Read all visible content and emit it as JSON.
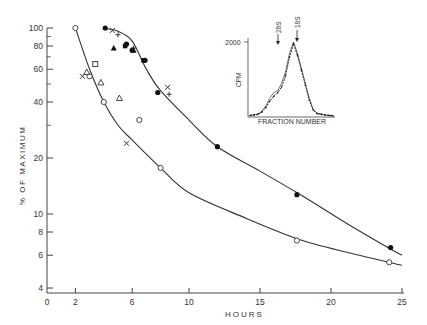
{
  "chart_data": [
    {
      "type": "scatter",
      "title": "",
      "xlabel": "HOURS",
      "ylabel": "% OF MAXIMUM",
      "yscale": "log",
      "xlim": [
        0,
        25
      ],
      "ylim": [
        4,
        100
      ],
      "x_ticks": [
        0,
        2,
        6,
        10,
        15,
        20,
        25
      ],
      "y_ticks": [
        4,
        6,
        8,
        10,
        20,
        40,
        60,
        80,
        100
      ],
      "y_tick_labels": [
        "4",
        "6",
        "8",
        "10",
        "20",
        "40",
        "60",
        "80",
        "100"
      ],
      "grid": false,
      "series": [
        {
          "name": "upper curve (filled circles)",
          "marker": "filled-circle",
          "fit_curve": [
            [
              4,
              100
            ],
            [
              5,
              96
            ],
            [
              6,
              85
            ],
            [
              7,
              60
            ],
            [
              8,
              46
            ],
            [
              10,
              32
            ],
            [
              12,
              23
            ],
            [
              15,
              17
            ],
            [
              18,
              12.5
            ],
            [
              21,
              9
            ],
            [
              24,
              6.6
            ],
            [
              25,
              6
            ]
          ],
          "points": [
            [
              4.1,
              100
            ],
            [
              5.6,
              82
            ],
            [
              6.0,
              76
            ],
            [
              6.9,
              67
            ],
            [
              7.8,
              45
            ],
            [
              12.0,
              23
            ],
            [
              17.6,
              12.7
            ],
            [
              24.2,
              6.6
            ]
          ]
        },
        {
          "name": "lower curve (open circles)",
          "marker": "open-circle",
          "fit_curve": [
            [
              2,
              100
            ],
            [
              3,
              60
            ],
            [
              4,
              40
            ],
            [
              5,
              30
            ],
            [
              6,
              25
            ],
            [
              8,
              17.7
            ],
            [
              10,
              13
            ],
            [
              14,
              9.5
            ],
            [
              18,
              7.2
            ],
            [
              22,
              6
            ],
            [
              25,
              5.3
            ]
          ],
          "points": [
            [
              2.0,
              100
            ],
            [
              3.0,
              55
            ],
            [
              4.0,
              40
            ],
            [
              6.5,
              32
            ],
            [
              8.0,
              17.7
            ],
            [
              17.6,
              7.2
            ],
            [
              24.1,
              5.5
            ]
          ]
        },
        {
          "name": "crosses (x)",
          "marker": "x",
          "points": [
            [
              2.5,
              55
            ],
            [
              4.6,
              97
            ],
            [
              5.6,
              24
            ],
            [
              8.5,
              48
            ]
          ]
        },
        {
          "name": "plus (+)",
          "marker": "plus",
          "points": [
            [
              5.0,
              92
            ],
            [
              6.1,
              78
            ],
            [
              8.6,
              44
            ]
          ]
        },
        {
          "name": "filled triangles",
          "marker": "filled-triangle",
          "points": [
            [
              4.7,
              78
            ],
            [
              6.1,
              76
            ]
          ]
        },
        {
          "name": "filled squares",
          "marker": "filled-square",
          "points": [
            [
              5.5,
              80
            ],
            [
              6.8,
              67
            ]
          ]
        },
        {
          "name": "open triangles",
          "marker": "open-triangle",
          "points": [
            [
              2.8,
              58
            ],
            [
              3.8,
              51
            ],
            [
              5.1,
              42
            ]
          ]
        },
        {
          "name": "open squares",
          "marker": "open-square",
          "points": [
            [
              3.4,
              64
            ]
          ]
        }
      ]
    },
    {
      "type": "line",
      "title": "inset",
      "xlabel": "FRACTION NUMBER",
      "ylabel": "CPM",
      "y_ticks": [
        2000
      ],
      "y_tick_labels": [
        "2000"
      ],
      "annotations": [
        {
          "label": "28S",
          "marker": "arrow-down"
        },
        {
          "label": "18S",
          "marker": "arrow-down"
        }
      ],
      "series": [
        {
          "name": "profile A (open)",
          "x": [
            1,
            2,
            3,
            4,
            5,
            6,
            7,
            8,
            9,
            10,
            11,
            12,
            13,
            14,
            15,
            16,
            17,
            18,
            19,
            20,
            21,
            22
          ],
          "values": [
            50,
            60,
            80,
            150,
            300,
            500,
            650,
            700,
            900,
            1200,
            1700,
            2000,
            1700,
            1300,
            900,
            500,
            200,
            100,
            80,
            60,
            50,
            40
          ]
        },
        {
          "name": "profile B (filled)",
          "x": [
            1,
            2,
            3,
            4,
            5,
            6,
            7,
            8,
            9,
            10,
            11,
            12,
            13,
            14,
            15,
            16,
            17,
            18,
            19,
            20,
            21,
            22
          ],
          "values": [
            40,
            50,
            70,
            130,
            250,
            420,
            550,
            650,
            800,
            1100,
            1600,
            1950,
            1650,
            1250,
            850,
            450,
            180,
            90,
            70,
            50,
            40,
            30
          ]
        }
      ]
    }
  ],
  "axis": {
    "x_label": "HOURS",
    "y_label": "% OF MAXIMUM",
    "x_tick_labels": [
      "0",
      "2",
      "6",
      "10",
      "15",
      "20",
      "25"
    ],
    "y_tick_labels": [
      "100",
      "80",
      "60",
      "40",
      "20",
      "10",
      "8",
      "6",
      "4"
    ]
  },
  "inset": {
    "x_label": "FRACTION NUMBER",
    "y_label": "CPM",
    "y_tick_label": "2000",
    "marker_28s": "28S",
    "marker_18s": "18S"
  }
}
